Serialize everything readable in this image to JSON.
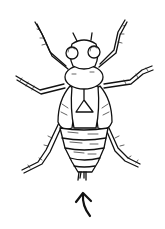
{
  "illustration": {
    "subject": "insect nymph line drawing",
    "style": "black ink on white",
    "ink_color": "#111111",
    "background_color": "#ffffff",
    "annotation": {
      "type": "arrow",
      "direction": "up",
      "points_to": "abdomen tip / tail cerci"
    }
  }
}
